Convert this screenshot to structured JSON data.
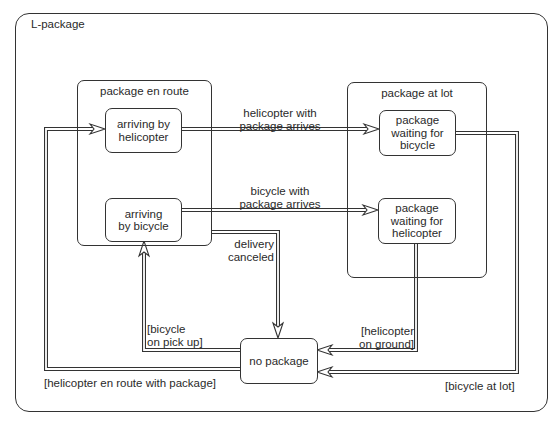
{
  "diagram": {
    "type": "state-machine",
    "frame_label": "L-package",
    "composites": [
      {
        "id": "package-en-route",
        "label": "package en route"
      },
      {
        "id": "package-at-lot",
        "label": "package at lot"
      }
    ],
    "states": {
      "arriving_by_helicopter": {
        "line1": "arriving by",
        "line2": "helicopter"
      },
      "arriving_by_bicycle": {
        "line1": "arriving",
        "line2": "by bicycle"
      },
      "waiting_for_bicycle": {
        "line1": "package",
        "line2": "waiting for",
        "line3": "bicycle"
      },
      "waiting_for_helicopter": {
        "line1": "package",
        "line2": "waiting for",
        "line3": "helicopter"
      },
      "no_package": {
        "line1": "no package"
      }
    },
    "transitions": {
      "heli_arrives": {
        "line1": "helicopter with",
        "line2": "package arrives"
      },
      "bike_arrives": {
        "line1": "bicycle with",
        "line2": "package arrives"
      },
      "delivery_canceled": {
        "line1": "delivery",
        "line2": "canceled"
      },
      "bicycle_pickup": {
        "line1": "[bicycle",
        "line2": "on pick up]"
      },
      "heli_en_route": {
        "line1": "[helicopter en route with package]"
      },
      "heli_on_ground": {
        "line1": "[helicopter",
        "line2": "on ground]"
      },
      "bicycle_at_lot": {
        "line1": "[bicycle at lot]"
      }
    },
    "colors": {
      "line": "#333333",
      "background": "#ffffff",
      "text": "#2a2a2a"
    }
  }
}
